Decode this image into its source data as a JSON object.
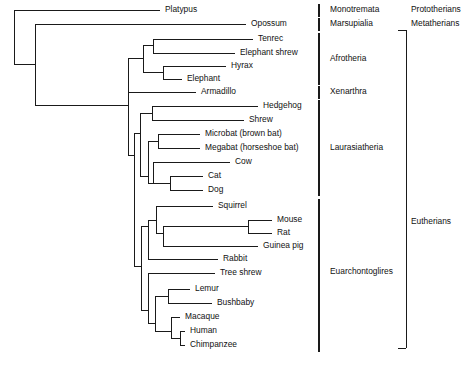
{
  "figure": {
    "width": 475,
    "height": 366,
    "line_color": "#1a1a1a",
    "background": "#ffffff"
  },
  "chart_data": {
    "type": "tree",
    "orientation": "left-to-right cladogram",
    "taxa": [
      "Platypus",
      "Opossum",
      "Tenrec",
      "Elephant shrew",
      "Hyrax",
      "Elephant",
      "Armadillo",
      "Hedgehog",
      "Shrew",
      "Microbat (brown bat)",
      "Megabat (horseshoe bat)",
      "Cow",
      "Cat",
      "Dog",
      "Squirrel",
      "Mouse",
      "Rat",
      "Guinea pig",
      "Rabbit",
      "Tree shrew",
      "Lemur",
      "Bushbaby",
      "Macaque",
      "Human",
      "Chimpanzee"
    ],
    "clades": [
      "Monotremata",
      "Marsupialia",
      "Afrotheria",
      "Xenarthra",
      "Laurasiatheria",
      "Euarchontoglires"
    ],
    "groups": [
      "Prototherians",
      "Metatherians",
      "Eutherians"
    ]
  },
  "leaves": [
    {
      "name": "Platypus",
      "y": 10,
      "tip_x": 160,
      "label_x": 165
    },
    {
      "name": "Opossum",
      "y": 24,
      "tip_x": 246,
      "label_x": 251
    },
    {
      "name": "Tenrec",
      "y": 39,
      "tip_x": 253,
      "label_x": 258
    },
    {
      "name": "Elephant shrew",
      "y": 53,
      "tip_x": 235,
      "label_x": 240
    },
    {
      "name": "Hyrax",
      "y": 66,
      "tip_x": 226,
      "label_x": 231
    },
    {
      "name": "Elephant",
      "y": 79,
      "tip_x": 182,
      "label_x": 187
    },
    {
      "name": "Armadillo",
      "y": 92,
      "tip_x": 196,
      "label_x": 201
    },
    {
      "name": "Hedgehog",
      "y": 106,
      "tip_x": 258,
      "label_x": 263
    },
    {
      "name": "Shrew",
      "y": 120,
      "tip_x": 244,
      "label_x": 249
    },
    {
      "name": "Microbat (brown bat)",
      "y": 134,
      "tip_x": 200,
      "label_x": 205
    },
    {
      "name": "Megabat (horseshoe bat)",
      "y": 148,
      "tip_x": 200,
      "label_x": 205
    },
    {
      "name": "Cow",
      "y": 162,
      "tip_x": 230,
      "label_x": 235
    },
    {
      "name": "Cat",
      "y": 176,
      "tip_x": 203,
      "label_x": 208
    },
    {
      "name": "Dog",
      "y": 190,
      "tip_x": 203,
      "label_x": 208
    },
    {
      "name": "Squirrel",
      "y": 206,
      "tip_x": 213,
      "label_x": 218
    },
    {
      "name": "Mouse",
      "y": 220,
      "tip_x": 272,
      "label_x": 277
    },
    {
      "name": "Rat",
      "y": 233,
      "tip_x": 272,
      "label_x": 277
    },
    {
      "name": "Guinea pig",
      "y": 246,
      "tip_x": 258,
      "label_x": 263
    },
    {
      "name": "Rabbit",
      "y": 259,
      "tip_x": 218,
      "label_x": 223
    },
    {
      "name": "Tree shrew",
      "y": 273,
      "tip_x": 215,
      "label_x": 220
    },
    {
      "name": "Lemur",
      "y": 289,
      "tip_x": 190,
      "label_x": 195
    },
    {
      "name": "Bushbaby",
      "y": 303,
      "tip_x": 212,
      "label_x": 217
    },
    {
      "name": "Macaque",
      "y": 317,
      "tip_x": 180,
      "label_x": 185
    },
    {
      "name": "Human",
      "y": 331,
      "tip_x": 185,
      "label_x": 190
    },
    {
      "name": "Chimpanzee",
      "y": 345,
      "tip_x": 185,
      "label_x": 190
    }
  ],
  "nodes": [
    {
      "name": "root",
      "x": 14,
      "y_top": 10,
      "y_bot": 64
    },
    {
      "name": "theria",
      "x": 35,
      "y_top": 24,
      "y_bot": 105
    },
    {
      "name": "eutheria",
      "x": 128,
      "y_top": 58,
      "y_bot": 155
    },
    {
      "name": "atlantogenata",
      "x": 128,
      "y_top": 58,
      "y_bot": 92
    },
    {
      "name": "afrotheria",
      "x": 143,
      "y_top": 45,
      "y_bot": 72
    },
    {
      "name": "tenrec-shrew",
      "x": 153,
      "y_top": 39,
      "y_bot": 53
    },
    {
      "name": "hyrax-elephant",
      "x": 163,
      "y_top": 66,
      "y_bot": 79
    },
    {
      "name": "boreoeutheria",
      "x": 134,
      "y_top": 133,
      "y_bot": 266
    },
    {
      "name": "laurasiatheria",
      "x": 140,
      "y_top": 113,
      "y_bot": 176
    },
    {
      "name": "eulipotyphla",
      "x": 152,
      "y_top": 106,
      "y_bot": 120
    },
    {
      "name": "scrotifera",
      "x": 148,
      "y_top": 141,
      "y_bot": 183
    },
    {
      "name": "chiroptera",
      "x": 158,
      "y_top": 134,
      "y_bot": 148
    },
    {
      "name": "ferungulata",
      "x": 153,
      "y_top": 162,
      "y_bot": 183
    },
    {
      "name": "carnivora",
      "x": 170,
      "y_top": 176,
      "y_bot": 190
    },
    {
      "name": "euarchontoglires",
      "x": 141,
      "y_top": 226,
      "y_bot": 310
    },
    {
      "name": "glires",
      "x": 148,
      "y_top": 220,
      "y_bot": 259
    },
    {
      "name": "rodentia",
      "x": 156,
      "y_top": 206,
      "y_bot": 233
    },
    {
      "name": "myomorpha-cavi",
      "x": 163,
      "y_top": 226,
      "y_bot": 246
    },
    {
      "name": "muridae",
      "x": 248,
      "y_top": 220,
      "y_bot": 233
    },
    {
      "name": "euarchonta",
      "x": 148,
      "y_top": 273,
      "y_bot": 323
    },
    {
      "name": "primates",
      "x": 155,
      "y_top": 296,
      "y_bot": 331
    },
    {
      "name": "strepsirrhini",
      "x": 168,
      "y_top": 289,
      "y_bot": 303
    },
    {
      "name": "haplorhini",
      "x": 171,
      "y_top": 317,
      "y_bot": 338
    },
    {
      "name": "hominidae",
      "x": 180,
      "y_top": 331,
      "y_bot": 345
    }
  ],
  "clade_bars": [
    {
      "label": "Monotremata",
      "label_x": 330,
      "label_y": 10,
      "bar_x": 319,
      "bar_top": 4,
      "bar_bot": 17
    },
    {
      "label": "Marsupialia",
      "label_x": 330,
      "label_y": 24,
      "bar_x": 319,
      "bar_top": 18,
      "bar_bot": 31
    },
    {
      "label": "Afrotheria",
      "label_x": 330,
      "label_y": 59,
      "bar_x": 319,
      "bar_top": 33,
      "bar_bot": 85
    },
    {
      "label": "Xenarthra",
      "label_x": 330,
      "label_y": 92,
      "bar_x": 319,
      "bar_top": 86,
      "bar_bot": 99
    },
    {
      "label": "Laurasiatheria",
      "label_x": 330,
      "label_y": 148,
      "bar_x": 319,
      "bar_top": 100,
      "bar_bot": 196
    },
    {
      "label": "Euarchontoglires",
      "label_x": 330,
      "label_y": 272,
      "bar_x": 319,
      "bar_top": 199,
      "bar_bot": 352
    }
  ],
  "group_labels": [
    {
      "label": "Prototherians",
      "x": 411,
      "y": 10
    },
    {
      "label": "Metatherians",
      "x": 411,
      "y": 24
    },
    {
      "label": "Eutherians",
      "x": 411,
      "y": 222
    }
  ],
  "group_bracket": {
    "name": "eutherians-bracket",
    "x": 406,
    "y_top": 30,
    "y_bot": 348,
    "tick_len": 8
  }
}
